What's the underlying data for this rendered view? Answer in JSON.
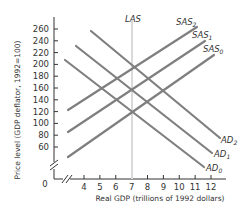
{
  "chart_data": {
    "type": "line",
    "title": "",
    "xlabel": "Real GDP (trillions of 1992 dollars)",
    "ylabel": "Price level (GDP deflator, 1992=100)",
    "x_ticks": [
      "4",
      "5",
      "6",
      "7",
      "8",
      "9",
      "10",
      "11",
      "12"
    ],
    "y_ticks": [
      "60",
      "80",
      "100",
      "120",
      "140",
      "160",
      "180",
      "200",
      "220",
      "240",
      "260"
    ],
    "origin_label": "0",
    "xlim": [
      2,
      12.5
    ],
    "ylim": [
      40,
      270
    ],
    "axis_breaks": true,
    "grid": false,
    "colors": {
      "curve": "#7f7f7f",
      "las": "#d9d9d9",
      "axis": "#333333"
    },
    "series": [
      {
        "name": "LAS",
        "label": "LAS",
        "sub": "",
        "kind": "vertical",
        "x": 7,
        "y_range": [
          40,
          270
        ]
      },
      {
        "name": "SAS0",
        "label": "SAS",
        "sub": "0",
        "kind": "upward",
        "points": [
          [
            3.0,
            54
          ],
          [
            12.2,
            227
          ]
        ]
      },
      {
        "name": "SAS1",
        "label": "SAS",
        "sub": "1",
        "kind": "upward",
        "points": [
          [
            3.0,
            97
          ],
          [
            11.6,
            251
          ]
        ]
      },
      {
        "name": "SAS2",
        "label": "SAS",
        "sub": "2",
        "kind": "upward",
        "points": [
          [
            3.0,
            134
          ],
          [
            11.1,
            275
          ]
        ]
      },
      {
        "name": "AD0",
        "label": "AD",
        "sub": "0",
        "kind": "downward",
        "points": [
          [
            2.8,
            205
          ],
          [
            11.5,
            25
          ]
        ]
      },
      {
        "name": "AD1",
        "label": "AD",
        "sub": "1",
        "kind": "downward",
        "points": [
          [
            3.5,
            229
          ],
          [
            12.0,
            49
          ]
        ]
      },
      {
        "name": "AD2",
        "label": "AD",
        "sub": "2",
        "kind": "downward",
        "points": [
          [
            4.2,
            254
          ],
          [
            12.5,
            73
          ]
        ]
      }
    ],
    "equilibria": [
      {
        "ad": "AD0",
        "sas": "SAS0",
        "x": 7,
        "y": 120
      },
      {
        "ad": "AD1",
        "sas": "SAS1",
        "x": 7,
        "y": 160
      },
      {
        "ad": "AD2",
        "sas": "SAS2",
        "x": 7,
        "y": 200
      }
    ]
  }
}
